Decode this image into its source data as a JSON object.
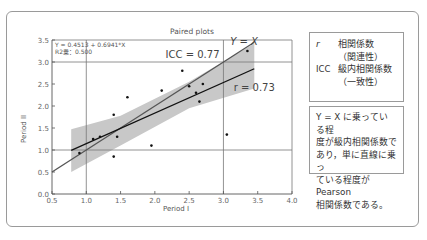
{
  "chart_data": {
    "type": "scatter",
    "title": "Paired plots",
    "xlabel": "Period I",
    "ylabel": "Period II",
    "xlim": [
      0.5,
      4.0
    ],
    "ylim": [
      0.0,
      3.5
    ],
    "xticks": [
      "0.5",
      "1.0",
      "1.5",
      "2.0",
      "2.5",
      "3.0",
      "3.5",
      "4.0"
    ],
    "yticks": [
      "0.0",
      "0.5",
      "1.0",
      "1.5",
      "2.0",
      "2.5",
      "3.0",
      "3.5"
    ],
    "reference_lines": {
      "x": [
        1.0,
        3.0
      ],
      "y": [
        1.0,
        3.0
      ]
    },
    "points": [
      {
        "x": 0.9,
        "y": 0.93
      },
      {
        "x": 1.1,
        "y": 1.25
      },
      {
        "x": 1.2,
        "y": 1.3
      },
      {
        "x": 1.4,
        "y": 1.8
      },
      {
        "x": 1.45,
        "y": 1.3
      },
      {
        "x": 1.4,
        "y": 0.85
      },
      {
        "x": 1.6,
        "y": 2.2
      },
      {
        "x": 1.95,
        "y": 1.1
      },
      {
        "x": 2.1,
        "y": 2.35
      },
      {
        "x": 2.4,
        "y": 2.8
      },
      {
        "x": 2.5,
        "y": 2.45
      },
      {
        "x": 2.6,
        "y": 2.3
      },
      {
        "x": 2.65,
        "y": 2.1
      },
      {
        "x": 2.7,
        "y": 2.5
      },
      {
        "x": 3.05,
        "y": 1.35
      },
      {
        "x": 3.35,
        "y": 3.25
      }
    ],
    "regression": {
      "equation": "Y = 0.4513 + 0.6941*X",
      "r2_label": "R2乗：0.500",
      "x_range": [
        0.78,
        3.45
      ]
    },
    "identity_line": {
      "label": "Y = X",
      "x_range": [
        0.5,
        3.45
      ]
    },
    "confidence_band": {
      "upper": [
        [
          0.78,
          1.47
        ],
        [
          1.5,
          1.78
        ],
        [
          2.5,
          2.55
        ],
        [
          3.45,
          3.42
        ]
      ],
      "lower": [
        [
          0.78,
          0.5
        ],
        [
          1.5,
          1.1
        ],
        [
          2.5,
          1.95
        ],
        [
          3.45,
          2.4
        ]
      ]
    },
    "annotations": [
      {
        "text": "ICC = 0.77",
        "x": 2.55,
        "y": 3.1
      },
      {
        "text": "Y = X",
        "x": 3.3,
        "y": 3.38
      },
      {
        "text": "r = 0.73",
        "x": 3.15,
        "y": 2.35
      }
    ]
  },
  "chart": {
    "title": "Paired plots",
    "xlabel": "Period I",
    "ylabel": "Period II",
    "equation": "Y = 0.4513 + 0.6941*X",
    "r2": "R2乗：0.500",
    "icc_label": "ICC = 0.77",
    "yx_label": "Y = X",
    "r_label": "r = 0.73"
  },
  "legend": {
    "r_symbol": "r",
    "r_name": "相関係数",
    "r_desc": "（関連性）",
    "icc_symbol": "ICC",
    "icc_name": "級内相関係数",
    "icc_desc": "（一致性）"
  },
  "note": {
    "lines": [
      "Y = X に乗っている程",
      "度が級内相関係数で",
      "あり，単に直線に乗っ",
      "ている程度がPearson",
      "相関係数である。"
    ]
  }
}
